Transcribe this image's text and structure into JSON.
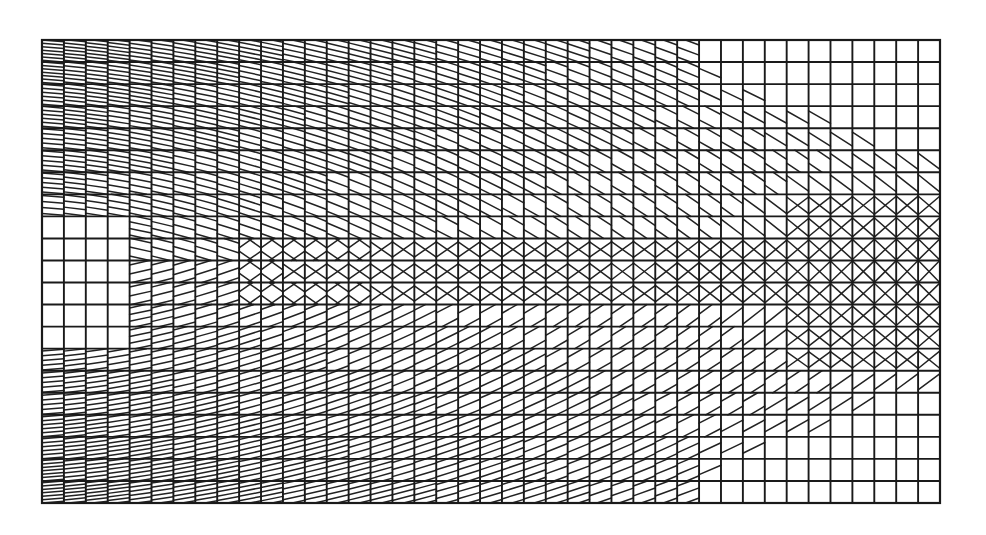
{
  "figure": {
    "title": "Quadrilateral finite element mesh with interior hatching",
    "type": "structured-mesh",
    "colors": {
      "background": "#ffffff",
      "line": "#1a1a1a",
      "hatch": "#222222"
    }
  },
  "mesh": {
    "origin_px": [
      42,
      40
    ],
    "extent_px": [
      940,
      503
    ],
    "columns": 41,
    "rows": 21,
    "hatch_density": {
      "max_lines_per_cell": 7,
      "description": "Dense horizontal/diagonal hatching on the left fading to sparse cells on the right; crossed (X) hatching along the central band and right-center region; blank cells in the left-center region and top-right/bottom-right corners"
    },
    "regions": {
      "blank_left_center": {
        "col_range": [
          0,
          3
        ],
        "row_range": [
          8,
          13
        ]
      },
      "crossed_center_band": {
        "row_range": [
          9,
          11
        ]
      },
      "crossed_right_zone": {
        "col_range": [
          34,
          40
        ],
        "row_range": [
          7,
          14
        ]
      },
      "sparse_top_right": {
        "col_range": [
          30,
          40
        ],
        "row_range": [
          0,
          5
        ]
      },
      "sparse_bottom_right": {
        "col_range": [
          30,
          40
        ],
        "row_range": [
          15,
          20
        ]
      }
    }
  }
}
